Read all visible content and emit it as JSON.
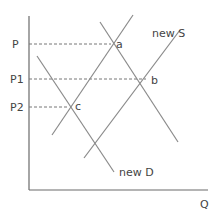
{
  "diagram": {
    "axes": {
      "x_label": "Q",
      "y_label": ""
    },
    "price_labels": [
      {
        "label": "P",
        "y": 44
      },
      {
        "label": "P1",
        "y": 79
      },
      {
        "label": "P2",
        "y": 107
      }
    ],
    "points": [
      {
        "label": "a",
        "x": 113,
        "y": 44
      },
      {
        "label": "b",
        "x": 148,
        "y": 79
      },
      {
        "label": "c",
        "x": 71,
        "y": 107
      }
    ],
    "line_labels": {
      "new_s": "new S",
      "new_d": "new D"
    },
    "colors": {
      "line": "#8a8a8a",
      "axis": "#6a6a6a",
      "text": "#444444"
    }
  }
}
